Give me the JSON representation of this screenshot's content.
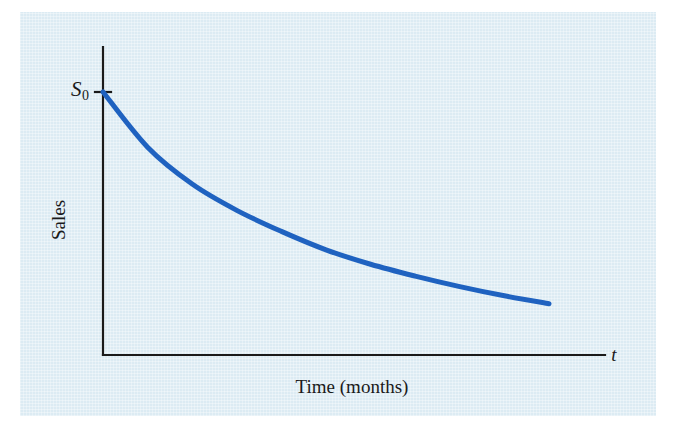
{
  "figure": {
    "background_color": "#ffffff",
    "panel_color": "#dcebf3"
  },
  "chart_data": {
    "type": "line",
    "title": "",
    "subtitle": "",
    "xlabel": "Time (months)",
    "ylabel": "Sales",
    "x_axis_variable": "t",
    "y_intercept_label": "S",
    "y_intercept_subscript": "0",
    "series": [
      {
        "name": "Sales decay",
        "color": "#1f62c0",
        "line_width": 5,
        "points": [
          {
            "x": 0.0,
            "y": 1.0
          },
          {
            "x": 0.1,
            "y": 0.79
          },
          {
            "x": 0.2,
            "y": 0.65
          },
          {
            "x": 0.3,
            "y": 0.55
          },
          {
            "x": 0.4,
            "y": 0.47
          },
          {
            "x": 0.5,
            "y": 0.4
          },
          {
            "x": 0.6,
            "y": 0.345
          },
          {
            "x": 0.7,
            "y": 0.3
          },
          {
            "x": 0.8,
            "y": 0.26
          },
          {
            "x": 0.9,
            "y": 0.225
          },
          {
            "x": 1.0,
            "y": 0.195
          }
        ]
      }
    ],
    "xlim": [
      0,
      1.12
    ],
    "ylim": [
      0,
      1.0
    ],
    "grid": false,
    "legend": "none",
    "ticks": {
      "x": [],
      "y": [
        "S0"
      ]
    },
    "annotations": [
      {
        "text": "S0",
        "position": "y-axis top tick",
        "note": "initial sales value marked with a short tick on the vertical axis"
      }
    ]
  },
  "axes": {
    "color": "#1a1a1a",
    "line_width": 2,
    "origin": {
      "x": 103,
      "y": 355
    },
    "y_axis_top": {
      "x": 103,
      "y": 47
    },
    "x_axis_right": {
      "x": 605,
      "y": 355
    },
    "tick_mark": {
      "x_from": 96,
      "x_to": 110,
      "y": 92
    }
  }
}
